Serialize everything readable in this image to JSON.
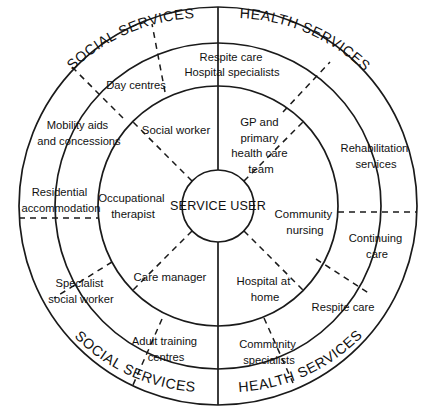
{
  "diagram": {
    "title": "SERVICE USER",
    "center_label": "SERVICE USER",
    "geometry": {
      "cx": 218,
      "cy": 206,
      "r_center": 36,
      "r_inner_ring": 120,
      "r_outer_ring": 199
    },
    "colors": {
      "background": "#ffffff",
      "stroke": "#1a1a1a",
      "text": "#111111"
    },
    "arc_headings": [
      {
        "id": "social-services-top",
        "text": "SOCIAL SERVICES",
        "side": "left",
        "position": "top"
      },
      {
        "id": "health-services-top",
        "text": "HEALTH SERVICES",
        "side": "right",
        "position": "top"
      },
      {
        "id": "social-services-bottom",
        "text": "SOCIAL SERVICES",
        "side": "left",
        "position": "bottom"
      },
      {
        "id": "health-services-bottom",
        "text": "HEALTH SERVICES",
        "side": "right",
        "position": "bottom"
      }
    ],
    "inner_ring": {
      "name": "inner-ring",
      "segments": [
        {
          "id": "social-worker",
          "lines": [
            "Social worker"
          ],
          "side": "social"
        },
        {
          "id": "gp-primary-health-care-team",
          "lines": [
            "GP and",
            "primary",
            "health care",
            "team"
          ],
          "side": "health"
        },
        {
          "id": "community-nursing",
          "lines": [
            "Community",
            "nursing"
          ],
          "side": "health"
        },
        {
          "id": "hospital-at-home",
          "lines": [
            "Hospital at",
            "home"
          ],
          "side": "health"
        },
        {
          "id": "care-manager",
          "lines": [
            "Care manager"
          ],
          "side": "social"
        },
        {
          "id": "occupational-therapist",
          "lines": [
            "Occupational",
            "therapist"
          ],
          "side": "social"
        }
      ]
    },
    "outer_ring": {
      "name": "outer-ring",
      "segments": [
        {
          "id": "respite-care-social",
          "lines": [
            "Respite care"
          ],
          "side": "social"
        },
        {
          "id": "day-centres",
          "lines": [
            "Day centres"
          ],
          "side": "social"
        },
        {
          "id": "mobility-aids-and-concessions",
          "lines": [
            "Mobility aids",
            "and concessions"
          ],
          "side": "social"
        },
        {
          "id": "residential-accommodation",
          "lines": [
            "Residential",
            "accommodation"
          ],
          "side": "social"
        },
        {
          "id": "specialist-social-worker",
          "lines": [
            "Specialist",
            "social worker"
          ],
          "side": "social"
        },
        {
          "id": "adult-training-centres",
          "lines": [
            "Adult training",
            "centres"
          ],
          "side": "social"
        },
        {
          "id": "hospital-specialists",
          "lines": [
            "Hospital specialists"
          ],
          "side": "health"
        },
        {
          "id": "rehabilitation-services",
          "lines": [
            "Rehabilitation",
            "services"
          ],
          "side": "health"
        },
        {
          "id": "continuing-care",
          "lines": [
            "Continuing",
            "care"
          ],
          "side": "health"
        },
        {
          "id": "respite-care-health",
          "lines": [
            "Respite care"
          ],
          "side": "health"
        },
        {
          "id": "community-specialists",
          "lines": [
            "Community",
            "specialists"
          ],
          "side": "health"
        }
      ]
    }
  }
}
